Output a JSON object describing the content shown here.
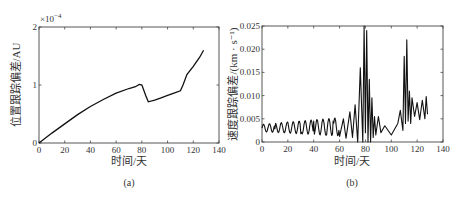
{
  "figure": {
    "panels": [
      {
        "id": "a",
        "caption": "(a)",
        "xlabel": "时间/天",
        "ylabel": "位置跟踪偏差/AU",
        "exponent_label": "×10",
        "exponent_power": "−4",
        "xticks": [
          "0",
          "20",
          "40",
          "60",
          "80",
          "100",
          "120",
          "140"
        ],
        "yticks": [
          "0",
          "1",
          "2"
        ]
      },
      {
        "id": "b",
        "caption": "(b)",
        "xlabel": "时间/天",
        "ylabel": "速度跟踪偏差/(km · s⁻¹)",
        "xticks": [
          "0",
          "20",
          "40",
          "60",
          "80",
          "100",
          "120",
          "140"
        ],
        "yticks": [
          "0",
          "0.005",
          "0.010",
          "0.015",
          "0.020",
          "0.025"
        ]
      }
    ]
  },
  "chart_data": [
    {
      "type": "line",
      "title": "(a)",
      "xlabel": "时间/天",
      "ylabel": "位置跟踪偏差/AU",
      "y_scale_note": "×10^-4",
      "xlim": [
        0,
        140
      ],
      "ylim": [
        0,
        2
      ],
      "grid": false,
      "legend": null,
      "x": [
        0,
        10,
        20,
        30,
        40,
        50,
        60,
        70,
        75,
        78,
        80,
        83,
        85,
        90,
        95,
        100,
        105,
        110,
        112,
        115,
        120,
        125,
        128
      ],
      "series": [
        {
          "name": "position tracking error (×1e-4 AU)",
          "values": [
            0,
            0.17,
            0.33,
            0.49,
            0.63,
            0.75,
            0.86,
            0.94,
            0.97,
            1.01,
            1.0,
            0.82,
            0.71,
            0.74,
            0.78,
            0.82,
            0.86,
            0.9,
            1.0,
            1.18,
            1.32,
            1.48,
            1.6
          ]
        }
      ]
    },
    {
      "type": "line",
      "title": "(b)",
      "xlabel": "时间/天",
      "ylabel": "速度跟踪偏差/(km·s⁻¹)",
      "xlim": [
        0,
        140
      ],
      "ylim": [
        0,
        0.025
      ],
      "grid": false,
      "legend": null,
      "description": "Oscillating velocity tracking error; baseline ~0.003 with ~0.0015 amplitude from 0-60 days, large bursts near 75-85 days (peak ~0.025) and 110-115 days (peak ~0.022), ending ~0.006-0.010 at 128 days",
      "x": [
        0,
        5,
        10,
        20,
        30,
        40,
        50,
        55,
        60,
        63,
        65,
        68,
        70,
        72,
        74,
        76,
        78,
        79,
        80,
        81,
        82,
        83,
        84,
        85,
        86,
        87,
        88,
        90,
        92,
        95,
        100,
        105,
        107,
        109,
        110,
        111,
        112,
        113,
        114,
        115,
        116,
        118,
        120,
        122,
        124,
        126,
        127,
        128
      ],
      "series": [
        {
          "name": "velocity tracking error",
          "values": [
            0.003,
            0.0035,
            0.0028,
            0.0042,
            0.0018,
            0.0045,
            0.0015,
            0.0045,
            0.0012,
            0.005,
            0.0008,
            0.0065,
            0.001,
            0.008,
            0.0,
            0.016,
            0.0,
            0.025,
            0.002,
            0.024,
            0.0,
            0.0135,
            0.0,
            0.0095,
            0.001,
            0.0055,
            0.0015,
            0.0055,
            0.002,
            0.0035,
            0.0015,
            0.004,
            0.0068,
            0.0025,
            0.0185,
            0.004,
            0.022,
            0.0045,
            0.011,
            0.004,
            0.0095,
            0.0055,
            0.0085,
            0.0048,
            0.009,
            0.005,
            0.0098,
            0.006
          ]
        }
      ]
    }
  ]
}
